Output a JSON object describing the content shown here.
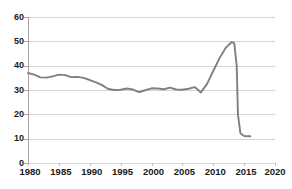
{
  "chart_data": {
    "type": "line",
    "title": "",
    "xlabel": "",
    "ylabel": "",
    "xlim": [
      1980,
      2020
    ],
    "ylim": [
      0,
      60
    ],
    "ytick_labels": [
      "0",
      "10",
      "20",
      "30",
      "40",
      "50",
      "60"
    ],
    "ytick_values": [
      0,
      10,
      20,
      30,
      40,
      50,
      60
    ],
    "xtick_labels": [
      "1980",
      "1985",
      "1990",
      "1995",
      "2000",
      "2005",
      "2010",
      "2015",
      "2020"
    ],
    "xtick_values": [
      1980,
      1985,
      1990,
      1995,
      2000,
      2005,
      2010,
      2015,
      2020
    ],
    "grid": "horizontal",
    "legend": "none",
    "line_color": "#808080",
    "series": [
      {
        "name": "series-1",
        "x": [
          1980,
          1981,
          1982,
          1983,
          1984,
          1985,
          1986,
          1987,
          1988,
          1989,
          1990,
          1991,
          1992,
          1993,
          1994,
          1995,
          1996,
          1997,
          1998,
          1999,
          2000,
          2001,
          2002,
          2003,
          2004,
          2005,
          2006,
          2007,
          2008,
          2009,
          2010,
          2011,
          2012,
          2013,
          2013.4,
          2013.8,
          2014,
          2014.4,
          2015,
          2016
        ],
        "values": [
          37.0,
          36.3,
          35.2,
          35.1,
          35.6,
          36.3,
          36.1,
          35.3,
          35.4,
          35.0,
          34.1,
          33.1,
          32.0,
          30.4,
          30.0,
          30.1,
          30.6,
          30.2,
          29.1,
          29.9,
          30.7,
          30.6,
          30.3,
          31.0,
          30.2,
          30.1,
          30.5,
          31.2,
          29.0,
          32.5,
          37.8,
          43.0,
          47.3,
          49.7,
          49.3,
          40.0,
          20.0,
          12.2,
          11.1,
          11.0
        ]
      }
    ]
  }
}
